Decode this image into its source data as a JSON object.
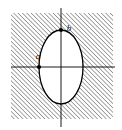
{
  "figure": {
    "background_color": "#ffffff",
    "hatch": {
      "region_name": "exterior-shaded-region",
      "x": 11,
      "y": 13,
      "width": 102,
      "height": 106,
      "pattern": "diagonal-lines-45deg",
      "line_color": "#3a3a3a",
      "line_width": 0.9,
      "spacing": 3.1,
      "direction": "lower-left-to-upper-right"
    },
    "ellipse": {
      "center_x": 61,
      "center_y": 67,
      "semi_axis_x": 22,
      "semi_axis_y": 37,
      "fill_color": "#ffffff",
      "stroke_color": "#000000",
      "stroke_width": 1.3
    },
    "axes": {
      "color": "#000000",
      "width": 0.9,
      "x_axis": {
        "x1": 11,
        "y1": 67,
        "x2": 115,
        "y2": 67
      },
      "y_axis": {
        "x1": 61,
        "y1": 8,
        "x2": 61,
        "y2": 127
      }
    },
    "vertex_markers": [
      {
        "name": "left-vertex-marker",
        "cx": 39,
        "cy": 67,
        "r": 2.1,
        "color": "#000000"
      },
      {
        "name": "top-vertex-marker",
        "cx": 61,
        "cy": 30,
        "r": 2.1,
        "color": "#000000"
      }
    ],
    "labels": {
      "semi_major_horizontal": {
        "text": "a",
        "x": 38,
        "y": 59,
        "anchor": "middle"
      },
      "semi_major_vertical": {
        "text": "b",
        "x": 69,
        "y": 31,
        "anchor": "middle"
      }
    }
  }
}
